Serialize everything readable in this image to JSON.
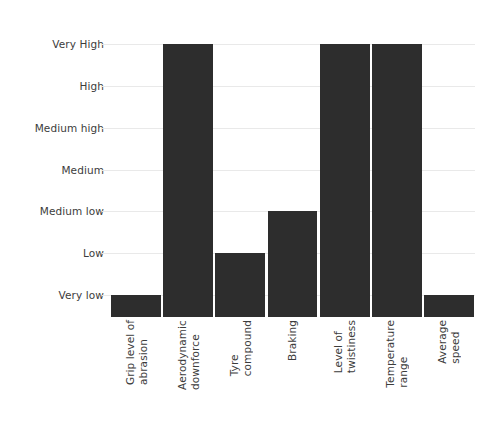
{
  "chart_data": {
    "type": "bar",
    "title": "",
    "subtitle": "",
    "xlabel": "",
    "ylabel": "",
    "orientation": "vertical",
    "grid": true,
    "legend": false,
    "legend_position": "none",
    "bar_color": "#2d2d2d",
    "background_color": "#ffffff",
    "gridline_color": "#e9e9e9",
    "axis_text_color": "#3c3c3c",
    "scale_type": "ordinal",
    "ylim": [
      0,
      7
    ],
    "ytick_labels": [
      "Very High",
      "High",
      "Medium high",
      "Medium",
      "Medium low",
      "Low",
      "Very low"
    ],
    "ytick_values": [
      7,
      6,
      5,
      4,
      3,
      2,
      1
    ],
    "categories": [
      "Grip level of\nabrasion",
      "Aerodynamic\ndownforce",
      "Tyre\ncompound",
      "Braking",
      "Level of\ntwistiness",
      "Temperature\nrange",
      "Average\nspeed"
    ],
    "values": [
      1,
      7,
      2,
      3,
      7,
      7,
      1
    ],
    "value_labels": [
      "Very low",
      "Very High",
      "Low",
      "Medium low",
      "Very High",
      "Very High",
      "Very low"
    ],
    "points": [
      {
        "category": "Grip level of abrasion",
        "value": 1,
        "label": "Very low"
      },
      {
        "category": "Aerodynamic downforce",
        "value": 7,
        "label": "Very High"
      },
      {
        "category": "Tyre compound",
        "value": 2,
        "label": "Low"
      },
      {
        "category": "Braking",
        "value": 3,
        "label": "Medium low"
      },
      {
        "category": "Level of twistiness",
        "value": 7,
        "label": "Very High"
      },
      {
        "category": "Temperature range",
        "value": 7,
        "label": "Very High"
      },
      {
        "category": "Average speed",
        "value": 1,
        "label": "Very low"
      }
    ]
  }
}
